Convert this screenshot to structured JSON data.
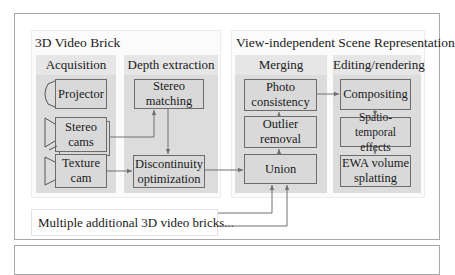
{
  "diagram": {
    "brick": {
      "title": "3D Video Brick",
      "acquisition": {
        "header": "Acquisition",
        "nodes": [
          {
            "id": "projector",
            "label": "Projector",
            "icon": "projector-icon"
          },
          {
            "id": "stereo_cams",
            "label": "Stereo\ncams",
            "icon": "camera-stack-icon"
          },
          {
            "id": "texture_cam",
            "label": "Texture\ncam",
            "icon": "camera-icon"
          }
        ]
      },
      "depth": {
        "header": "Depth extraction",
        "nodes": [
          {
            "id": "stereo_matching",
            "label": "Stereo\nmatching"
          },
          {
            "id": "discontinuity",
            "label": "Discontinuity\noptimization"
          }
        ]
      }
    },
    "scene": {
      "title": "View-independent Scene Representation",
      "merging": {
        "header": "Merging",
        "nodes": [
          {
            "id": "photo",
            "label": "Photo\nconsistency"
          },
          {
            "id": "outlier",
            "label": "Outlier\nremoval"
          },
          {
            "id": "union",
            "label": "Union"
          }
        ]
      },
      "editing": {
        "header": "Editing/rendering",
        "nodes": [
          {
            "id": "compositing",
            "label": "Compositing"
          },
          {
            "id": "spatio",
            "label": "Spatio-temporal\neffects"
          },
          {
            "id": "ewa",
            "label": "EWA volume\nsplatting"
          }
        ]
      }
    },
    "note": "Multiple additional 3D video bricks...",
    "edges": [
      {
        "from": "stereo_cams",
        "to": "stereo_matching"
      },
      {
        "from": "stereo_matching",
        "to": "discontinuity"
      },
      {
        "from": "texture_cam",
        "to": "discontinuity"
      },
      {
        "from": "discontinuity",
        "to": "union"
      },
      {
        "from": "union",
        "to": "outlier"
      },
      {
        "from": "outlier",
        "to": "photo"
      },
      {
        "from": "photo",
        "to": "compositing"
      },
      {
        "from": "compositing",
        "to": "spatio"
      },
      {
        "from": "spatio",
        "to": "ewa"
      },
      {
        "from": "note",
        "to": "union"
      },
      {
        "from": "note",
        "to": "union"
      }
    ],
    "colors": {
      "frame_border": "#a8a8a8",
      "column_fill": "#dcdcdc",
      "box_fill": "#d9d9d9",
      "box_border": "#6c6c6c",
      "arrow": "#707070"
    }
  }
}
